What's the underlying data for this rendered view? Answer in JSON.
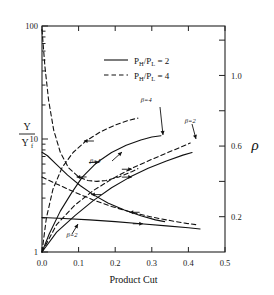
{
  "chart_data": {
    "type": "line",
    "title": "",
    "xlabel": "Product Cut",
    "ylabel_left_num": "Y",
    "ylabel_left_den": "Y",
    "ylabel_left_den_sub": "f",
    "ylabel_right": "ρ",
    "xlim": [
      0.0,
      0.5
    ],
    "xticks": [
      0.0,
      0.1,
      0.2,
      0.3,
      0.4,
      0.5
    ],
    "xticklabels": [
      "0.0",
      "0.1",
      "0.2",
      "0.3",
      "0.4",
      "0.5"
    ],
    "left_axis_scale": "log",
    "ylim_left": [
      1,
      100
    ],
    "yticks_left": [
      1,
      10,
      100
    ],
    "yticklabels_left": [
      "1",
      "10",
      "100"
    ],
    "right_axis_scale": "linear",
    "ylim_right": [
      0.0,
      1.28
    ],
    "yticks_right": [
      0.2,
      0.4,
      0.6,
      0.8,
      1.0,
      1.2
    ],
    "yticklabels_right": [
      "0.2",
      "",
      "0.6",
      "",
      "1.0",
      ""
    ],
    "grid": false,
    "legend_position": "upper-center",
    "legend": [
      {
        "label_prefix": "P",
        "sub1": "H",
        "slash": "/P",
        "sub2": "L",
        "value": "= 2",
        "style": "solid"
      },
      {
        "label_prefix": "P",
        "sub1": "H",
        "slash": "/P",
        "sub2": "L",
        "value": "= 4",
        "style": "dashed"
      }
    ],
    "annotations": [
      {
        "text": "β=4",
        "x": 0.285,
        "y_px": 102,
        "target": "yield-beta4"
      },
      {
        "text": "β=4",
        "x": 0.145,
        "y_px": 163,
        "target": "rho-beta4"
      },
      {
        "text": "β=2",
        "x": 0.405,
        "y_px": 123,
        "target": "yield-beta2"
      },
      {
        "text": "β=2",
        "x": 0.082,
        "y_px": 237,
        "target": "rho-beta2"
      }
    ],
    "series": [
      {
        "name": "Y/Yf, beta=4, PH/PL=2",
        "axis": "left",
        "style": "solid",
        "arrow": "right",
        "points": [
          [
            0.0,
            1.0
          ],
          [
            0.02,
            1.45
          ],
          [
            0.05,
            2.3
          ],
          [
            0.08,
            3.3
          ],
          [
            0.11,
            4.6
          ],
          [
            0.15,
            6.2
          ],
          [
            0.19,
            7.6
          ],
          [
            0.23,
            8.8
          ],
          [
            0.27,
            9.8
          ],
          [
            0.3,
            10.4
          ],
          [
            0.325,
            10.7
          ]
        ]
      },
      {
        "name": "Y/Yf, beta=4, PH/PL=4",
        "axis": "left",
        "style": "dashed",
        "arrow": "left",
        "points": [
          [
            0.0,
            1.0
          ],
          [
            0.012,
            2.0
          ],
          [
            0.03,
            3.6
          ],
          [
            0.055,
            5.6
          ],
          [
            0.085,
            7.6
          ],
          [
            0.12,
            9.6
          ],
          [
            0.16,
            11.6
          ],
          [
            0.2,
            13.3
          ],
          [
            0.235,
            14.6
          ],
          [
            0.262,
            15.3
          ]
        ]
      },
      {
        "name": "Y/Yf, beta=2, PH/PL=2",
        "axis": "left",
        "style": "solid",
        "arrow": "right",
        "points": [
          [
            0.0,
            1.0
          ],
          [
            0.04,
            1.5
          ],
          [
            0.09,
            2.1
          ],
          [
            0.14,
            2.85
          ],
          [
            0.19,
            3.7
          ],
          [
            0.24,
            4.6
          ],
          [
            0.29,
            5.5
          ],
          [
            0.34,
            6.4
          ],
          [
            0.385,
            7.2
          ],
          [
            0.41,
            7.6
          ]
        ]
      },
      {
        "name": "Y/Yf, beta=2, PH/PL=4",
        "axis": "left",
        "style": "dashed",
        "arrow": "right",
        "points": [
          [
            0.0,
            1.0
          ],
          [
            0.04,
            1.75
          ],
          [
            0.09,
            2.6
          ],
          [
            0.14,
            3.5
          ],
          [
            0.19,
            4.4
          ],
          [
            0.24,
            5.4
          ],
          [
            0.29,
            6.4
          ],
          [
            0.34,
            7.5
          ],
          [
            0.38,
            8.5
          ],
          [
            0.405,
            9.2
          ]
        ]
      },
      {
        "name": "rho, beta=4, PH/PL=2",
        "axis": "right",
        "style": "solid",
        "arrow": "left",
        "points": [
          [
            0.0,
            0.565
          ],
          [
            0.015,
            0.545
          ],
          [
            0.04,
            0.495
          ],
          [
            0.07,
            0.435
          ],
          [
            0.105,
            0.375
          ],
          [
            0.14,
            0.325
          ],
          [
            0.18,
            0.278
          ],
          [
            0.225,
            0.238
          ],
          [
            0.27,
            0.205
          ],
          [
            0.31,
            0.182
          ],
          [
            0.335,
            0.172
          ]
        ]
      },
      {
        "name": "rho, beta=4, PH/PL=4",
        "axis": "right",
        "style": "dashed",
        "arrow": "left",
        "points": [
          [
            0.0,
            1.26
          ],
          [
            0.008,
            1.05
          ],
          [
            0.018,
            0.86
          ],
          [
            0.032,
            0.69
          ],
          [
            0.05,
            0.565
          ],
          [
            0.072,
            0.478
          ],
          [
            0.1,
            0.425
          ],
          [
            0.125,
            0.405
          ],
          [
            0.15,
            0.4
          ],
          [
            0.175,
            0.405
          ],
          [
            0.21,
            0.425
          ],
          [
            0.245,
            0.455
          ],
          [
            0.262,
            0.472
          ]
        ]
      },
      {
        "name": "rho, beta=2, PH/PL=2",
        "axis": "right",
        "style": "solid",
        "arrow": "right",
        "points": [
          [
            0.0,
            0.195
          ],
          [
            0.06,
            0.19
          ],
          [
            0.13,
            0.182
          ],
          [
            0.2,
            0.172
          ],
          [
            0.27,
            0.16
          ],
          [
            0.34,
            0.148
          ],
          [
            0.4,
            0.137
          ],
          [
            0.432,
            0.13
          ]
        ]
      },
      {
        "name": "rho, beta=2, PH/PL=4",
        "axis": "right",
        "style": "dashed",
        "arrow": "left",
        "points": [
          [
            0.0,
            0.425
          ],
          [
            0.04,
            0.385
          ],
          [
            0.09,
            0.338
          ],
          [
            0.14,
            0.295
          ],
          [
            0.19,
            0.258
          ],
          [
            0.245,
            0.225
          ],
          [
            0.3,
            0.198
          ],
          [
            0.35,
            0.178
          ],
          [
            0.395,
            0.162
          ],
          [
            0.42,
            0.155
          ]
        ]
      }
    ]
  }
}
